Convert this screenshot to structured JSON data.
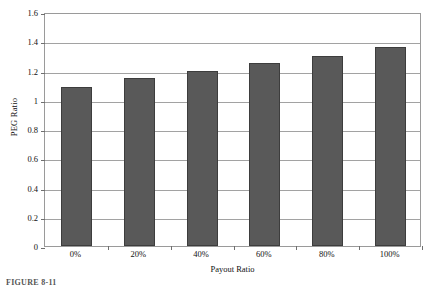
{
  "chart_data": {
    "type": "bar",
    "title": "",
    "subtitle": "",
    "xlabel": "Payout Ratio",
    "ylabel": "PEG Ratio",
    "categories": [
      "0%",
      "20%",
      "40%",
      "60%",
      "80%",
      "100%"
    ],
    "values": [
      1.09,
      1.15,
      1.2,
      1.25,
      1.3,
      1.36
    ],
    "series": [
      {
        "name": "PEG Ratio",
        "values": [
          1.09,
          1.15,
          1.2,
          1.25,
          1.3,
          1.36
        ]
      }
    ],
    "ylim": [
      0,
      1.6
    ],
    "ytick_labels": [
      "1.6",
      "1.4",
      "1.2",
      "1",
      "0.8",
      "0.6",
      "0.4",
      "0.2",
      "0"
    ],
    "ytick_values": [
      1.6,
      1.4,
      1.2,
      1.0,
      0.8,
      0.6,
      0.4,
      0.2,
      0
    ],
    "grid": true,
    "grid_axis": "y",
    "legend": false,
    "legend_position": "none",
    "bar_color": "#595959",
    "bar_edge_color": "#3d3d3d",
    "grid_color": "#a2a2a2",
    "plot_border_color": "#9a9a9a",
    "background_color": "#ffffff"
  },
  "caption": {
    "text": "FIGURE 8-11"
  }
}
